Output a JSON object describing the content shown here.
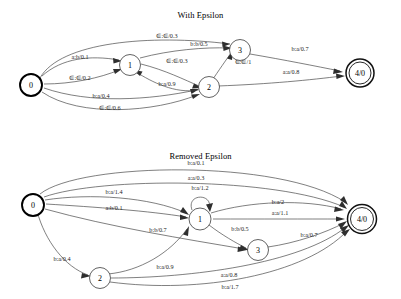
{
  "figures": [
    {
      "title": "With Epsilon",
      "nodes": [
        {
          "id": "0",
          "label": "0",
          "type": "start"
        },
        {
          "id": "1",
          "label": "1",
          "type": "normal"
        },
        {
          "id": "2",
          "label": "2",
          "type": "normal"
        },
        {
          "id": "3",
          "label": "3",
          "type": "normal"
        },
        {
          "id": "4",
          "label": "4/0",
          "type": "accept"
        }
      ],
      "edges": [
        {
          "from": "0",
          "to": "3",
          "label": "∈:∈/0.3"
        },
        {
          "from": "0",
          "to": "1",
          "label": "a:b/0.1"
        },
        {
          "from": "0",
          "to": "1",
          "label": "∈:∈/0.2"
        },
        {
          "from": "0",
          "to": "2",
          "label": "b:a/0.4"
        },
        {
          "from": "0",
          "to": "2",
          "label": "∈:∈/0.6"
        },
        {
          "from": "1",
          "to": "3",
          "label": "b:b/0.5"
        },
        {
          "from": "1",
          "to": "2",
          "label": "∈:∈/0.3"
        },
        {
          "from": "2",
          "to": "1",
          "label": "b:a/0.9"
        },
        {
          "from": "2",
          "to": "3",
          "label": "∈:∈/1"
        },
        {
          "from": "2",
          "to": "4",
          "label": "a:a/0.8"
        },
        {
          "from": "3",
          "to": "4",
          "label": "b:a/0.7"
        }
      ]
    },
    {
      "title": "Removed Epsilon",
      "nodes": [
        {
          "id": "0",
          "label": "0",
          "type": "start"
        },
        {
          "id": "1",
          "label": "1",
          "type": "normal"
        },
        {
          "id": "2",
          "label": "2",
          "type": "normal"
        },
        {
          "id": "3",
          "label": "3",
          "type": "normal"
        },
        {
          "id": "4",
          "label": "4/0",
          "type": "accept"
        }
      ],
      "edges": [
        {
          "from": "0",
          "to": "4",
          "label": "b:a/0.1"
        },
        {
          "from": "0",
          "to": "4",
          "label": "a:a/0.3"
        },
        {
          "from": "0",
          "to": "1",
          "label": "b:a/1.4"
        },
        {
          "from": "0",
          "to": "1",
          "label": "a:b/0.1"
        },
        {
          "from": "0",
          "to": "3",
          "label": "b:b/0.7"
        },
        {
          "from": "0",
          "to": "2",
          "label": "b:a/0.4"
        },
        {
          "from": "1",
          "to": "1",
          "label": "b:a/1.2"
        },
        {
          "from": "1",
          "to": "4",
          "label": "b:a/2"
        },
        {
          "from": "1",
          "to": "4",
          "label": "a:a/1.1"
        },
        {
          "from": "1",
          "to": "3",
          "label": "b:b/0.5"
        },
        {
          "from": "2",
          "to": "1",
          "label": "b:a/0.9"
        },
        {
          "from": "2",
          "to": "4",
          "label": "a:a/0.8"
        },
        {
          "from": "2",
          "to": "4",
          "label": "b:a/1.7"
        },
        {
          "from": "3",
          "to": "4",
          "label": "b:a/0.7"
        }
      ]
    }
  ]
}
